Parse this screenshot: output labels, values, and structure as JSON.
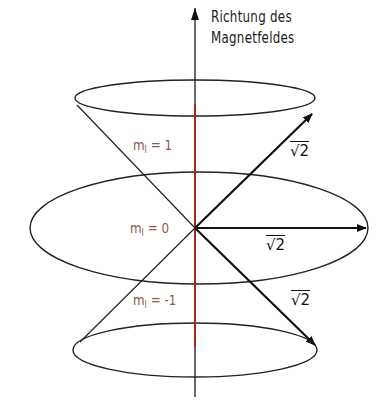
{
  "axis_label": {
    "line1": "Richtung des",
    "line2": "Magnetfeldes"
  },
  "levels": [
    {
      "symbol": "m",
      "subscript": "l",
      "eq": "= 1"
    },
    {
      "symbol": "m",
      "subscript": "l",
      "eq": "= 0"
    },
    {
      "symbol": "m",
      "subscript": "l",
      "eq": "= -1"
    }
  ],
  "vector_labels": {
    "upper": "√2",
    "middle": "√2",
    "lower": "√2"
  },
  "colors": {
    "axis": "#1a1a1a",
    "z_component": "#a02a1e",
    "label": "#8b5a4a",
    "lines": "#222222"
  }
}
